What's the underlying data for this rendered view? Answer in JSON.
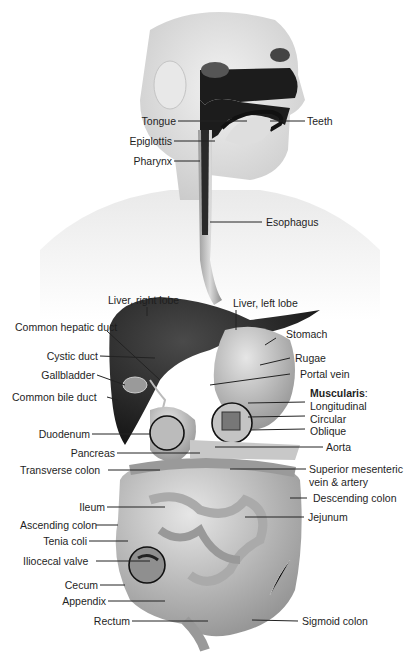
{
  "diagram": {
    "labels": {
      "tongue": "Tongue",
      "epiglottis": "Epiglottis",
      "pharynx": "Pharynx",
      "teeth": "Teeth",
      "esophagus": "Esophagus",
      "liver_right_lobe": "Liver, right lobe",
      "liver_left_lobe": "Liver, left lobe",
      "common_hepatic_duct": "Common hepatic duct",
      "stomach": "Stomach",
      "cystic_duct": "Cystic duct",
      "rugae": "Rugae",
      "gallbladder": "Gallbladder",
      "portal_vein": "Portal vein",
      "common_bile_duct": "Common bile duct",
      "muscularis": "Muscularis",
      "muscularis_colon": ":",
      "longitudinal": "Longitudinal",
      "circular": "Circular",
      "oblique": "Oblique",
      "duodenum": "Duodenum",
      "aorta": "Aorta",
      "pancreas": "Pancreas",
      "transverse_colon": "Transverse colon",
      "superior_mesenteric_1": "Superior mesenteric",
      "superior_mesenteric_2": "vein & artery",
      "descending_colon": "Descending colon",
      "ileum": "Ileum",
      "jejunum": "Jejunum",
      "ascending_colon": "Ascending colon",
      "tenia_coli": "Tenia coli",
      "iliocecal_valve": "Iliocecal valve",
      "cecum": "Cecum",
      "appendix": "Appendix",
      "rectum": "Rectum",
      "sigmoid_colon": "Sigmoid colon"
    },
    "colors": {
      "label_text": "#1e1e1e",
      "leader_line": "#222222",
      "organ_dark": "#1c1c1c",
      "organ_mid": "#8a8a8a",
      "organ_light": "#d2d2d2",
      "skin": "#e6e6e6"
    }
  }
}
